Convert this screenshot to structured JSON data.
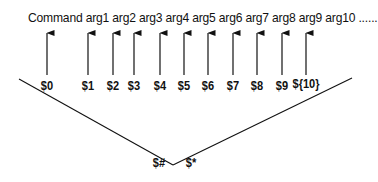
{
  "diagram": {
    "command_line": "Command arg1 arg2 arg3 arg4 arg5 arg6 arg7 arg8 arg9 arg10 ......",
    "tokens": [
      "Command",
      "arg1",
      "arg2",
      "arg3",
      "arg4",
      "arg5",
      "arg6",
      "arg7",
      "arg8",
      "arg9",
      "arg10",
      "......"
    ],
    "params": [
      {
        "label": "$0",
        "x": 47
      },
      {
        "label": "$1",
        "x": 88
      },
      {
        "label": "$2",
        "x": 113
      },
      {
        "label": "$3",
        "x": 134
      },
      {
        "label": "$4",
        "x": 160
      },
      {
        "label": "$5",
        "x": 184
      },
      {
        "label": "$6",
        "x": 208
      },
      {
        "label": "$7",
        "x": 233
      },
      {
        "label": "$8",
        "x": 257
      },
      {
        "label": "$9",
        "x": 282
      },
      {
        "label": "${10}",
        "x": 306
      }
    ],
    "count_label": "$#",
    "all_label": "$*",
    "line_color": "#111111"
  }
}
